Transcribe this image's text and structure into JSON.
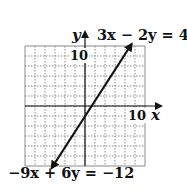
{
  "chart_data": {
    "type": "line",
    "title": "",
    "xlabel": "x",
    "ylabel": "y",
    "xlim": [
      -12,
      12
    ],
    "ylim": [
      -12,
      12
    ],
    "grid": true,
    "grid_step": 2,
    "tick_labels": {
      "x": "10",
      "y": "10"
    },
    "series": [
      {
        "name": "3x − 2y = 4",
        "equation": "y = 1.5x - 2",
        "x": [
          -6.67,
          9.33
        ],
        "y": [
          -12,
          12
        ]
      },
      {
        "name": "−9x + 6y = −12",
        "equation": "y = 1.5x - 2",
        "x": [
          -6.67,
          9.33
        ],
        "y": [
          -12,
          12
        ]
      }
    ],
    "annotations": [
      {
        "text": "3x − 2y = 4",
        "position": "top-right"
      },
      {
        "text": "−9x + 6y = −12",
        "position": "bottom-left"
      }
    ]
  },
  "labels": {
    "y_axis": "y",
    "x_axis": "x",
    "y_tick": "10",
    "x_tick": "10",
    "eq_top": "3x − 2y = 4",
    "eq_bottom": "−9x + 6y = −12"
  },
  "colors": {
    "line": "#111111",
    "grid": "#8a8a8a",
    "axis": "#111111"
  }
}
